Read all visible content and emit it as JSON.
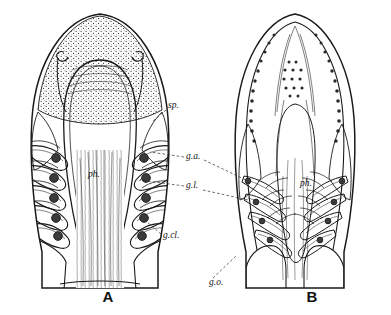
{
  "plate": {
    "description": "Two line-engraved anatomical figures of a fish head dissected from below, showing the pharynx and gill apparatus",
    "background_color": "#ffffff",
    "ink_color": "#1a1a1a",
    "shade_color": "#6f6f6f",
    "figures": [
      {
        "id": "A",
        "letter": "A",
        "letter_x": 108,
        "letter_y": 302,
        "center_x": 100,
        "gill_arch_count": 5,
        "snout_texture": "stippled"
      },
      {
        "id": "B",
        "letter": "B",
        "letter_x": 312,
        "letter_y": 302,
        "center_x": 295,
        "gill_arch_count": 4,
        "snout_texture": "toothed-margin"
      }
    ],
    "labels": [
      {
        "key": "sp",
        "text": "sp.",
        "x": 168,
        "y": 108,
        "figure": "A",
        "meaning": "spiracle"
      },
      {
        "key": "ga",
        "text": "g.a.",
        "x": 186,
        "y": 159,
        "figure": "both",
        "meaning": "gill arch"
      },
      {
        "key": "gl",
        "text": "g.l.",
        "x": 186,
        "y": 188,
        "figure": "both",
        "meaning": "gill lamella"
      },
      {
        "key": "gcl",
        "text": "g.cl.",
        "x": 163,
        "y": 238,
        "figure": "A",
        "meaning": "gill cleft"
      },
      {
        "key": "go",
        "text": "g.o.",
        "x": 209,
        "y": 285,
        "figure": "B",
        "meaning": "gill opening"
      },
      {
        "key": "ph_a",
        "text": "ph.",
        "x": 88,
        "y": 177,
        "figure": "A",
        "meaning": "pharynx"
      },
      {
        "key": "ph_b",
        "text": "ph.",
        "x": 300,
        "y": 186,
        "figure": "B",
        "meaning": "pharynx"
      }
    ]
  }
}
